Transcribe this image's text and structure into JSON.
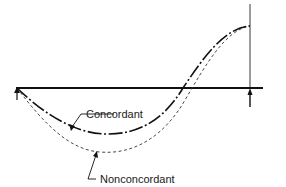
{
  "diagram": {
    "type": "prestressed-continuous-beam-tendon-profile",
    "labels": {
      "concordant": "Concordant",
      "nonconcordant": "Nonconcordant"
    },
    "curves": [
      {
        "name": "Concordant",
        "style": "dash-dot",
        "color": "#111111"
      },
      {
        "name": "Nonconcordant",
        "style": "dashed",
        "color": "#333333"
      }
    ],
    "supports": [
      {
        "name": "left-support",
        "type": "upward-arrow"
      },
      {
        "name": "right-support",
        "type": "upward-arrow"
      }
    ]
  }
}
